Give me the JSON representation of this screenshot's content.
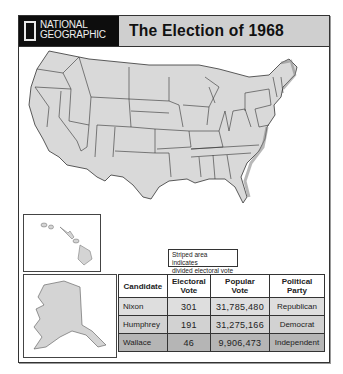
{
  "header": {
    "logo_line1": "NATIONAL",
    "logo_line2": "GEOGRAPHIC",
    "title": "The Election of 1968"
  },
  "map": {
    "region": "United States (contiguous)",
    "insets": [
      "Hawaii",
      "Alaska"
    ],
    "fill_color": "#d9d9d9",
    "border_color": "#333333"
  },
  "legend": {
    "line1": "Striped area indicates",
    "line2": "divided electoral vote"
  },
  "table": {
    "headers": {
      "candidate": "Candidate",
      "electoral_1": "Electoral",
      "electoral_2": "Vote",
      "popular_1": "Popular",
      "popular_2": "Vote",
      "party_1": "Political",
      "party_2": "Party"
    },
    "rows": [
      {
        "candidate": "Nixon",
        "electoral": "301",
        "popular": "31,785,480",
        "party": "Republican"
      },
      {
        "candidate": "Humphrey",
        "electoral": "191",
        "popular": "31,275,166",
        "party": "Democrat"
      },
      {
        "candidate": "Wallace",
        "electoral": "46",
        "popular": "9,906,473",
        "party": "Independent"
      }
    ]
  }
}
